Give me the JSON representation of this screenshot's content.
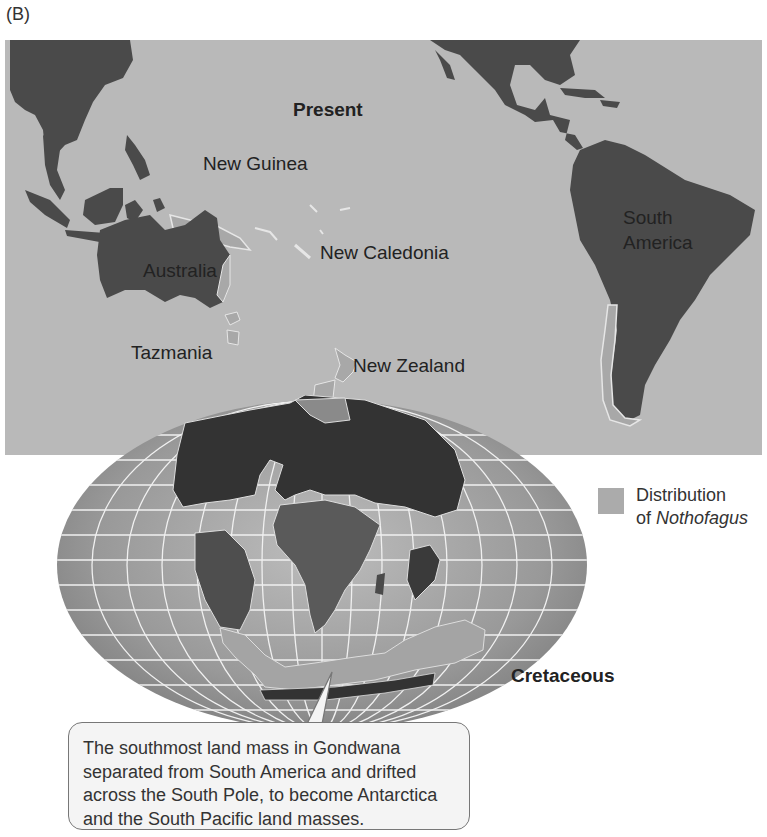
{
  "figure": {
    "panel_label": "(B)",
    "present_map": {
      "title": "Present",
      "labels": {
        "new_guinea": "New Guinea",
        "australia": "Australia",
        "new_caledonia": "New Caledonia",
        "tazmania": "Tazmania",
        "new_zealand": "New Zealand",
        "south_america_line1": "South",
        "south_america_line2": "America"
      }
    },
    "cretaceous_map": {
      "title": "Cretaceous"
    },
    "legend": {
      "line1": "Distribution",
      "line2_prefix": "of ",
      "line2_italic": "Nothofagus",
      "swatch_color": "#ababab"
    },
    "callout": {
      "text": "The southmost land mass in Gondwana separated from South America and drifted across the South Pole, to become Antarctica and the South Pacific land masses."
    },
    "colors": {
      "ocean": "#b9b9b9",
      "land": "#4a4a4a",
      "nothofagus": "#a8a8a8",
      "globe_ocean": "#8e8e8e"
    }
  }
}
